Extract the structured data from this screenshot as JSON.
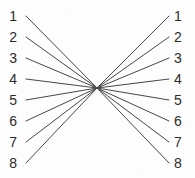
{
  "diagram": {
    "type": "bipartite-crossbar",
    "title": "",
    "width": 195,
    "height": 178,
    "background_color": "#fdfdfd",
    "line_color": "#474747",
    "line_width": 1,
    "label_color": "#2b2b2b",
    "label_font_size": 14,
    "convergence_point": {
      "x": 97,
      "y": 88
    },
    "left_column": {
      "label_x": 17,
      "edge_start_x": 26,
      "nodes": [
        {
          "label": "1",
          "y": 16
        },
        {
          "label": "2",
          "y": 37
        },
        {
          "label": "3",
          "y": 58
        },
        {
          "label": "4",
          "y": 79
        },
        {
          "label": "5",
          "y": 100
        },
        {
          "label": "6",
          "y": 121
        },
        {
          "label": "7",
          "y": 142
        },
        {
          "label": "8",
          "y": 163
        }
      ]
    },
    "right_column": {
      "label_x": 174,
      "edge_start_x": 169,
      "nodes": [
        {
          "label": "1",
          "y": 16
        },
        {
          "label": "2",
          "y": 37
        },
        {
          "label": "3",
          "y": 58
        },
        {
          "label": "4",
          "y": 79
        },
        {
          "label": "5",
          "y": 100
        },
        {
          "label": "6",
          "y": 121
        },
        {
          "label": "7",
          "y": 142
        },
        {
          "label": "8",
          "y": 163
        }
      ]
    }
  }
}
